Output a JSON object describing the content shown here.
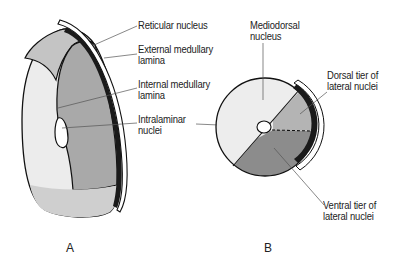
{
  "figure": {
    "panels": [
      {
        "id": "A",
        "label": "A",
        "view": "lateral view of thalamus"
      },
      {
        "id": "B",
        "label": "B",
        "view": "cross-section of thalamus"
      }
    ],
    "labels_a": {
      "reticular_nucleus": "Reticular nucleus",
      "external_medullary_1": "External medullary",
      "external_medullary_2": "lamina",
      "internal_medullary_1": "Internal medullary",
      "internal_medullary_2": "lamina",
      "intralaminar_1": "Intralaminar",
      "intralaminar_2": "nuclei"
    },
    "labels_b": {
      "mediodorsal_1": "Mediodorsal",
      "mediodorsal_2": "nucleus",
      "dorsal_tier_1": "Dorsal tier of",
      "dorsal_tier_2": "lateral nuclei",
      "ventral_tier_1": "Ventral tier of",
      "ventral_tier_2": "lateral nuclei"
    },
    "colors": {
      "outline": "#111111",
      "light_fill": "#eeeeee",
      "mid_fill": "#b4b4b4",
      "dark_fill": "#8c8c8c",
      "lamina": "#1a1a1a"
    }
  }
}
